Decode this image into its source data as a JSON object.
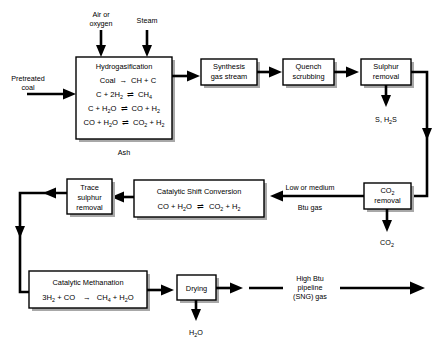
{
  "diagram": {
    "type": "process-flow-diagram"
  },
  "inputs": {
    "air_oxygen_line1": "Air or",
    "air_oxygen_line2": "oxygen",
    "steam": "Steam",
    "pretreated_line1": "Pretreated",
    "pretreated_line2": "coal"
  },
  "units": {
    "hydrogasification": {
      "title": "Hydrogasification",
      "equations": [
        {
          "lhs": "Coal",
          "arrow": "→",
          "rhs": "CH + C"
        },
        {
          "lhs": "C + 2H",
          "lhs_sub": "2",
          "arrow": "⇌",
          "rhs": "CH",
          "rhs_sub": "4"
        },
        {
          "lhs": "C + H",
          "lhs_sub": "2",
          "lhs_tail": "O",
          "arrow": "⇌",
          "rhs": "CO + H",
          "rhs_sub": "2"
        },
        {
          "lhs": "CO + H",
          "lhs_sub": "2",
          "lhs_tail": "O",
          "arrow": "⇌",
          "rhs": "CO",
          "rhs_sub": "2",
          "rhs_tail": " + H",
          "rhs_sub2": "2"
        }
      ],
      "eq_plain": [
        "Coal → CH + C",
        "C + 2H2 ⇌ CH4",
        "C + H2O ⇌ CO + H2",
        "CO + H2O ⇌ CO2 + H2"
      ]
    },
    "synthesis_gas": {
      "line1": "Synthesis",
      "line2": "gas stream"
    },
    "quench": {
      "line1": "Quench",
      "line2": "scrubbing"
    },
    "sulphur_removal": {
      "line1": "Sulphur",
      "line2": "removal"
    },
    "co2_removal": {
      "line1": "CO",
      "line1_sub": "2",
      "line2": "removal"
    },
    "trace_sulphur": {
      "line1": "Trace",
      "line2": "sulphur",
      "line3": "removal"
    },
    "shift_conversion": {
      "title": "Catalytic Shift Conversion",
      "eq_plain": "CO + H2O ⇌ CO2 + H2"
    },
    "methanation": {
      "title": "Catalytic Methanation",
      "eq_plain": "3H2 + CO → CH4 + H2O"
    },
    "drying": {
      "label": "Drying"
    }
  },
  "outputs": {
    "ash": "Ash",
    "sulphur_products": "S,  H",
    "sulphur_products_sub": "2",
    "sulphur_products_tail": "S",
    "co2": "CO",
    "co2_sub": "2",
    "water": "H",
    "water_sub": "2",
    "water_tail": "O"
  },
  "stream_labels": {
    "low_btu_line1": "Low or medium",
    "low_btu_line2": "Btu gas",
    "high_btu_line1": "High Btu",
    "high_btu_line2": "pipeline",
    "high_btu_line3": "(SNG) gas"
  },
  "colors": {
    "line": "#000000",
    "box_fill": "#ffffff",
    "box_stroke": "#000000",
    "shadow": "#a8a8a8",
    "background": "#ffffff"
  }
}
